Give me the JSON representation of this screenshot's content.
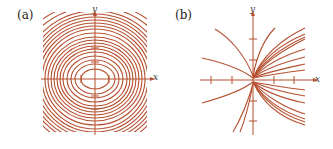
{
  "chart_data": [
    {
      "type": "line",
      "panel_label": "(a)",
      "title": "Closed elliptical orbits (centered at origin)",
      "xlabel": "x",
      "ylabel": "y",
      "grid": false,
      "color": "#b5502f",
      "description": "Family of concentric ellipses centered at the origin, wider in x than y; outer curves clipped by a square frame, densely packed bands near top and bottom",
      "ellipses_rx_ry": [
        [
          14,
          10
        ],
        [
          20,
          15
        ],
        [
          24,
          19
        ],
        [
          28,
          23
        ],
        [
          32,
          27
        ],
        [
          35,
          30
        ],
        [
          38,
          33
        ],
        [
          41,
          36
        ],
        [
          44,
          39
        ],
        [
          47,
          42
        ],
        [
          50,
          46
        ],
        [
          53,
          50
        ],
        [
          56,
          53
        ],
        [
          59,
          56
        ],
        [
          62,
          59
        ],
        [
          65,
          62
        ],
        [
          68,
          65
        ],
        [
          72,
          68
        ],
        [
          78,
          72
        ],
        [
          85,
          76
        ]
      ],
      "x_ticks": [
        -1,
        1
      ],
      "y_ticks": [
        -2,
        -1,
        1,
        2
      ]
    },
    {
      "type": "line",
      "panel_label": "(b)",
      "title": "Trajectories emanating from near origin",
      "xlabel": "x",
      "ylabel": "y",
      "grid": false,
      "color": "#b5502f",
      "description": "Family of curves passing through the origin; curves fan out to the right with both upward and downward branches, and a few curves extend to the left",
      "x_ticks": [
        -2,
        -1,
        1,
        2
      ],
      "y_ticks": [
        -2,
        -1,
        1,
        2
      ]
    }
  ],
  "labels": {
    "a": "(a)",
    "b": "(b)",
    "x": "x",
    "y": "y"
  }
}
